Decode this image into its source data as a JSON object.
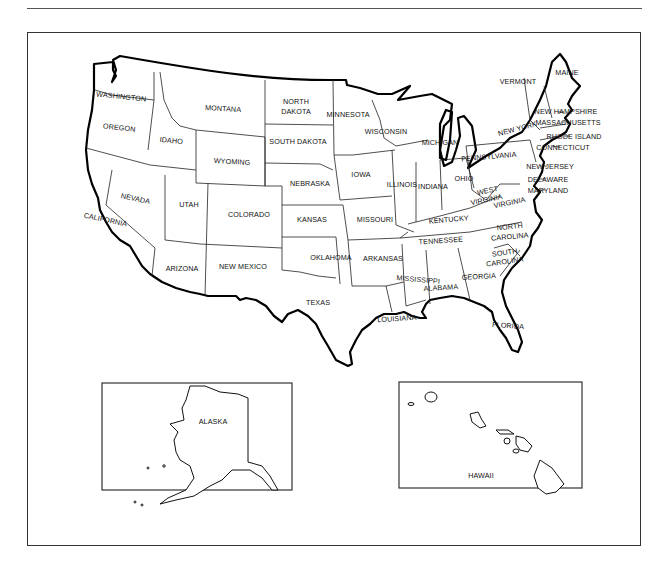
{
  "map": {
    "title": "United States map with state names",
    "states": [
      {
        "name": "WASHINGTON",
        "x": 121,
        "y": 99,
        "rot": 6
      },
      {
        "name": "OREGON",
        "x": 119,
        "y": 130,
        "rot": 6
      },
      {
        "name": "IDAHO",
        "x": 171,
        "y": 143,
        "rot": 6
      },
      {
        "name": "MONTANA",
        "x": 223,
        "y": 111,
        "rot": 3
      },
      {
        "name": "WYOMING",
        "x": 232,
        "y": 164,
        "rot": 3
      },
      {
        "name": "NORTH",
        "x": 296,
        "y": 104,
        "rot": 0
      },
      {
        "name": "DAKOTA",
        "x": 296,
        "y": 114,
        "rot": 0
      },
      {
        "name": "SOUTH DAKOTA",
        "x": 298,
        "y": 144,
        "rot": 0
      },
      {
        "name": "NEBRASKA",
        "x": 310,
        "y": 186,
        "rot": 0
      },
      {
        "name": "KANSAS",
        "x": 312,
        "y": 222,
        "rot": 0
      },
      {
        "name": "OKLAHOMA",
        "x": 331,
        "y": 260,
        "rot": 0
      },
      {
        "name": "TEXAS",
        "x": 318,
        "y": 305,
        "rot": 0
      },
      {
        "name": "MINNESOTA",
        "x": 348,
        "y": 117,
        "rot": 0
      },
      {
        "name": "WISCONSIN",
        "x": 386,
        "y": 134,
        "rot": 0
      },
      {
        "name": "IOWA",
        "x": 361,
        "y": 177,
        "rot": 0
      },
      {
        "name": "MISSOURI",
        "x": 375,
        "y": 222,
        "rot": 0
      },
      {
        "name": "ARKANSAS",
        "x": 383,
        "y": 261,
        "rot": 0
      },
      {
        "name": "LOUISIANA",
        "x": 397,
        "y": 321,
        "rot": -4
      },
      {
        "name": "MICHIGAN",
        "x": 440,
        "y": 145,
        "rot": 0
      },
      {
        "name": "ILLINOIS",
        "x": 402,
        "y": 187,
        "rot": 0
      },
      {
        "name": "INDIANA",
        "x": 433,
        "y": 189,
        "rot": 0
      },
      {
        "name": "OHIO",
        "x": 464,
        "y": 181,
        "rot": 0
      },
      {
        "name": "KENTUCKY",
        "x": 449,
        "y": 222,
        "rot": -5
      },
      {
        "name": "TENNESSEE",
        "x": 441,
        "y": 243,
        "rot": -4
      },
      {
        "name": "MISSISSIPPI",
        "x": 418,
        "y": 282,
        "rot": 5
      },
      {
        "name": "ALABAMA",
        "x": 441,
        "y": 290,
        "rot": -3
      },
      {
        "name": "GEORGIA",
        "x": 479,
        "y": 279,
        "rot": -3
      },
      {
        "name": "FLORIDA",
        "x": 508,
        "y": 328,
        "rot": 4
      },
      {
        "name": "SOUTH",
        "x": 505,
        "y": 255,
        "rot": -8
      },
      {
        "name": "CAROLINA",
        "x": 505,
        "y": 264,
        "rot": -8
      },
      {
        "name": "NORTH",
        "x": 510,
        "y": 229,
        "rot": -5
      },
      {
        "name": "CAROLINA",
        "x": 510,
        "y": 239,
        "rot": -5
      },
      {
        "name": "VIRGINIA",
        "x": 510,
        "y": 205,
        "rot": -12
      },
      {
        "name": "WEST",
        "x": 488,
        "y": 193,
        "rot": -12
      },
      {
        "name": "VIRGINIA",
        "x": 487,
        "y": 202,
        "rot": -12
      },
      {
        "name": "PENNSYLVANIA",
        "x": 489,
        "y": 159,
        "rot": -5
      },
      {
        "name": "NEW YORK",
        "x": 518,
        "y": 131,
        "rot": -15
      },
      {
        "name": "VERMONT",
        "x": 518,
        "y": 84,
        "rot": 0
      },
      {
        "name": "MAINE",
        "x": 567,
        "y": 75,
        "rot": 0
      },
      {
        "name": "NEVADA",
        "x": 135,
        "y": 201,
        "rot": 12
      },
      {
        "name": "CALIFORNIA",
        "x": 105,
        "y": 222,
        "rot": 12
      },
      {
        "name": "UTAH",
        "x": 189,
        "y": 207,
        "rot": 0
      },
      {
        "name": "COLORADO",
        "x": 249,
        "y": 217,
        "rot": 0
      },
      {
        "name": "ARIZONA",
        "x": 182,
        "y": 271,
        "rot": 0
      },
      {
        "name": "NEW MEXICO",
        "x": 243,
        "y": 269,
        "rot": 0
      }
    ],
    "callouts": [
      {
        "name": "NEW HAMPSHIRE",
        "x": 566,
        "y": 111
      },
      {
        "name": "MASSACHUSETTS",
        "x": 568,
        "y": 122
      },
      {
        "name": "RHODE ISLAND",
        "x": 574,
        "y": 136
      },
      {
        "name": "CONNECTICUT",
        "x": 563,
        "y": 147
      },
      {
        "name": "NEW JERSEY",
        "x": 550,
        "y": 166
      },
      {
        "name": "DELAWARE",
        "x": 548,
        "y": 179
      },
      {
        "name": "MARYLAND",
        "x": 548,
        "y": 190
      }
    ],
    "insets": {
      "alaska": {
        "label": "ALASKA"
      },
      "hawaii": {
        "label": "HAWAII"
      }
    }
  }
}
